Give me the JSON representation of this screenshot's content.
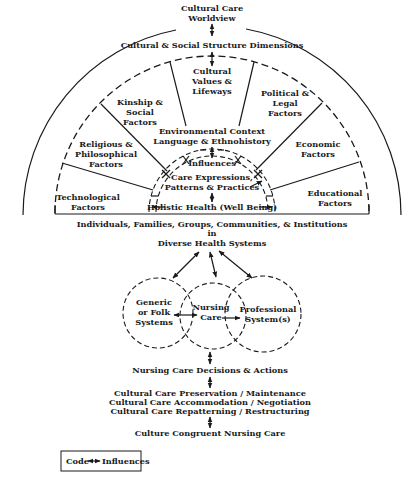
{
  "diagram": {
    "title_line1": "Cultural Care",
    "title_line2": "Worldview",
    "structure_dimensions": "Cultural & Social Structure Dimensions",
    "factors": {
      "cultural_values": [
        "Cultural",
        "Values &",
        "Lifeways"
      ],
      "kinship": [
        "Kinship &",
        "Social",
        "Factors"
      ],
      "political": [
        "Political &",
        "Legal",
        "Factors"
      ],
      "religious": [
        "Religious &",
        "Philosophical",
        "Factors"
      ],
      "economic": [
        "Economic",
        "Factors"
      ],
      "technological": [
        "Technological",
        "Factors"
      ],
      "educational": [
        "Educational",
        "Factors"
      ]
    },
    "environmental_context": [
      "Environmental Context",
      "Language & Ethnohistory"
    ],
    "influences": "Influences",
    "care_expressions": [
      "Care Expressions,",
      "Patterns & Practices"
    ],
    "holistic_health": "Holistic Health (Well Being)",
    "individuals": [
      "Individuals, Families, Groups, Communities, & Institutions",
      "in",
      "Diverse Health Systems"
    ],
    "systems": {
      "generic": [
        "Generic",
        "or Folk",
        "Systems"
      ],
      "nursing": [
        "Nursing",
        "Care"
      ],
      "professional": [
        "Professional",
        "System(s)"
      ]
    },
    "decisions": "Nursing Care Decisions & Actions",
    "modes": [
      "Cultural Care Preservation / Maintenance",
      "Cultural Care Accommodation / Negotiation",
      "Cultural Care Repatterning / Restructuring"
    ],
    "outcome": "Culture Congruent Nursing Care",
    "legend": {
      "code_label": "Code",
      "meaning_label": "Influences"
    }
  }
}
